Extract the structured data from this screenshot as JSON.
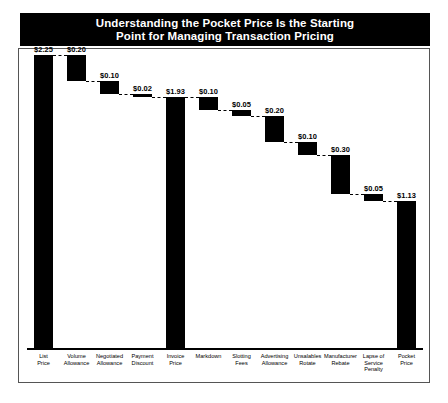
{
  "title": {
    "line1": "Understanding the Pocket Price Is the Starting",
    "line2": "Point for Managing Transaction Pricing"
  },
  "chart_data": {
    "type": "bar",
    "subtype": "waterfall",
    "title": "Understanding the Pocket Price Is the Starting Point for Managing Transaction Pricing",
    "xlabel": "",
    "ylabel": "",
    "ylim": [
      0,
      2.25
    ],
    "grid": false,
    "legend": null,
    "currency": "$",
    "categories": [
      "List Price",
      "Volume Allowance",
      "Negotiated Allowance",
      "Payment Discount",
      "Invoice Price",
      "Markdown",
      "Slotting Fees",
      "Advertising Allowance",
      "Unsalables Rotate",
      "Manufacturer Rebate",
      "Lapse of Service Penalty",
      "Pocket Price"
    ],
    "category_labels_multiline": [
      "List\nPrice",
      "Volume\nAllowance",
      "Negotiated\nAllowance",
      "Payment\nDiscount",
      "Invoice\nPrice",
      "Markdown",
      "Slotting\nFees",
      "Advertising\nAllowance",
      "Unsalables\nRotate",
      "Manufacturer\nRebate",
      "Lapse of\nService\nPenalty",
      "Pocket\nPrice"
    ],
    "values": [
      2.25,
      0.2,
      0.1,
      0.02,
      1.93,
      0.1,
      0.05,
      0.2,
      0.1,
      0.3,
      0.05,
      1.13
    ],
    "value_labels": [
      "$2.25",
      "$0.20",
      "$0.10",
      "$0.02",
      "$1.93",
      "$0.10",
      "$0.05",
      "$0.20",
      "$0.10",
      "$0.30",
      "$0.05",
      "$1.13"
    ],
    "kinds": [
      "total",
      "decrease",
      "decrease",
      "decrease",
      "total",
      "decrease",
      "decrease",
      "decrease",
      "decrease",
      "decrease",
      "decrease",
      "total"
    ],
    "running_top": [
      2.25,
      2.25,
      2.05,
      1.95,
      1.93,
      1.93,
      1.83,
      1.78,
      1.58,
      1.48,
      1.18,
      1.13
    ],
    "running_bottom": [
      0.0,
      2.05,
      1.95,
      1.93,
      0.0,
      1.83,
      1.78,
      1.58,
      1.48,
      1.18,
      1.13,
      0.0
    ],
    "bar_color": "#000000"
  },
  "colors": {
    "bar": "#000000",
    "banner_bg": "#000000",
    "banner_text": "#ffffff",
    "frame": "#555555",
    "background": "#ffffff"
  }
}
